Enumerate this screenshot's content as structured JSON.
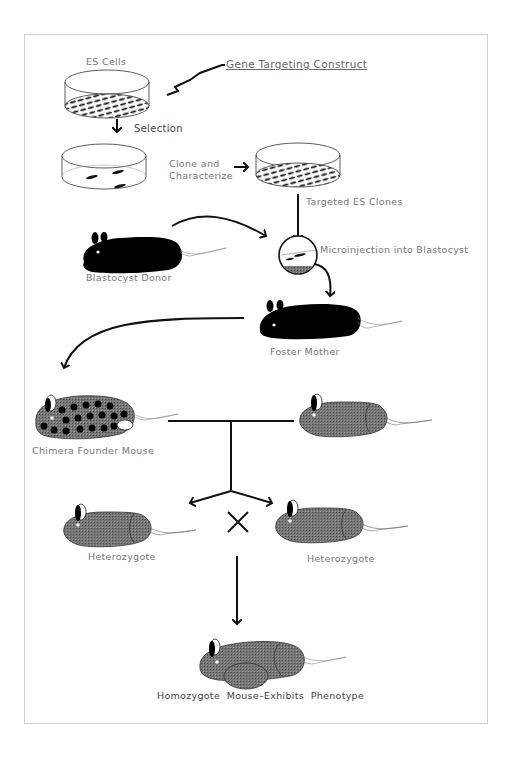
{
  "diagram": {
    "labels": {
      "es_cells": "ES Cells",
      "gene_targeting_construct": "Gene Targeting Construct",
      "selection": "Selection",
      "clone_and": "Clone and",
      "characterize": "Characterize",
      "targeted_es_clones": "Targeted ES Clones",
      "blastocyst_donor": "Blastocyst Donor",
      "microinjection": "Microinjection into Blastocyst",
      "foster_mother": "Foster Mother",
      "chimera_founder": "Chimera Founder Mouse",
      "heterozygote_left": "Heterozygote",
      "heterozygote_right": "Heterozygote",
      "homozygote": "Homozygote  Mouse–Exhibits  Phenotype"
    },
    "cross_symbol": "×",
    "nodes": [
      {
        "id": "es-cells-dish",
        "type": "culture-dish",
        "fill": "dense-cells"
      },
      {
        "id": "selection-dish",
        "type": "culture-dish",
        "fill": "sparse-colonies"
      },
      {
        "id": "targeted-clones-dish",
        "type": "culture-dish",
        "fill": "dense-cells"
      },
      {
        "id": "blastocyst-donor",
        "type": "mouse",
        "color": "black"
      },
      {
        "id": "blastocyst",
        "type": "blastocyst-circle"
      },
      {
        "id": "foster-mother",
        "type": "mouse",
        "color": "black"
      },
      {
        "id": "chimera-founder",
        "type": "mouse",
        "color": "spotted"
      },
      {
        "id": "wildtype-mate",
        "type": "mouse",
        "color": "grey"
      },
      {
        "id": "heterozygote-left",
        "type": "mouse",
        "color": "grey"
      },
      {
        "id": "heterozygote-right",
        "type": "mouse",
        "color": "grey"
      },
      {
        "id": "homozygote",
        "type": "mouse",
        "color": "grey"
      }
    ],
    "edges": [
      {
        "from": "gene-targeting-construct",
        "to": "es-cells-dish",
        "style": "zigzag"
      },
      {
        "from": "es-cells-dish",
        "to": "selection-dish",
        "label": "Selection"
      },
      {
        "from": "selection-dish",
        "to": "targeted-clones-dish",
        "label": "Clone and Characterize"
      },
      {
        "from": "targeted-clones-dish",
        "to": "blastocyst",
        "label": "Targeted ES Clones"
      },
      {
        "from": "blastocyst-donor",
        "to": "blastocyst"
      },
      {
        "from": "blastocyst",
        "to": "foster-mother",
        "label": "Microinjection into Blastocyst"
      },
      {
        "from": "foster-mother",
        "to": "chimera-founder"
      },
      {
        "from": "chimera-founder",
        "to": "heterozygote-left",
        "via": "cross-with-wildtype-mate"
      },
      {
        "from": "chimera-founder",
        "to": "heterozygote-right",
        "via": "cross-with-wildtype-mate"
      },
      {
        "from": "heterozygote-cross",
        "to": "homozygote"
      }
    ],
    "colors": {
      "line": "#111111",
      "mouse_black": "#000000",
      "mouse_grey": "#6b6b6b",
      "label": "#777777",
      "frame": "#cfcfcf"
    }
  }
}
